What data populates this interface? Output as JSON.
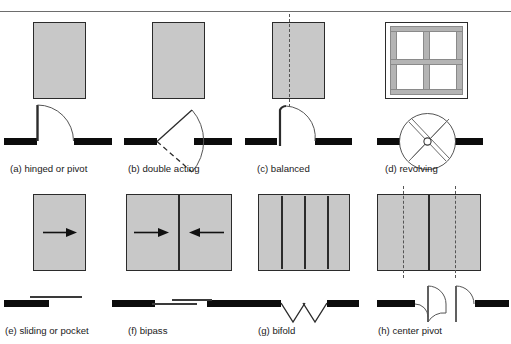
{
  "figure": {
    "title": "",
    "background_color": "#ffffff",
    "panel_fill": "#c8c8c8",
    "panel_stroke": "#2b2b2b",
    "wall_color": "#0c0c0c",
    "swing_line_color": "#3a3a3a"
  },
  "rows": [
    {
      "row_index": 1,
      "doors": [
        {
          "key": "hinged-or-pivot",
          "caption": "(a) hinged or pivot",
          "elevation": "single solid panel",
          "plan": "single leaf with quarter-circle swing arc"
        },
        {
          "key": "double-acting",
          "caption": "(b) double acting",
          "elevation": "single solid panel",
          "plan": "leaf swinging both directions, one solid one dashed"
        },
        {
          "key": "balanced",
          "caption": "(c) balanced",
          "elevation": "single panel with pivot axis line",
          "plan": "offset pivot leaf with swing arc"
        },
        {
          "key": "revolving",
          "caption": "(d) revolving",
          "elevation": "framed glass enclosure with mullions",
          "plan": "circle with four radial leaves and center hub"
        }
      ]
    },
    {
      "row_index": 2,
      "doors": [
        {
          "key": "sliding-or-pocket",
          "caption": "(e) sliding or pocket",
          "elevation": "single panel with right-pointing arrow",
          "plan": "panel sliding behind wall"
        },
        {
          "key": "bipass",
          "caption": "(f) bipass",
          "elevation": "two panels with opposing arrows",
          "plan": "two offset sliding panels"
        },
        {
          "key": "bifold",
          "caption": "(g) bifold",
          "elevation": "four hinged panels",
          "plan": "two folded V pairs"
        },
        {
          "key": "center-pivot",
          "caption": "(h) center pivot",
          "elevation": "two panels with dashed pivot axes",
          "plan": "two leaves rotating about center pivots"
        }
      ]
    }
  ]
}
